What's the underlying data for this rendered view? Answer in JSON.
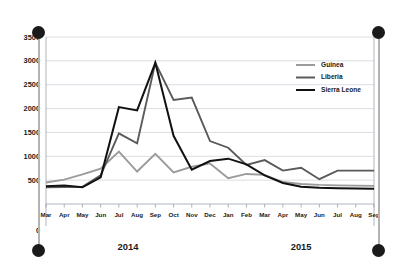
{
  "chart_data": {
    "type": "line",
    "title": "",
    "subtitle": "",
    "xlabel": "",
    "ylabel": "",
    "ylim": [
      0,
      3500
    ],
    "yticks": [
      0,
      500,
      1000,
      1500,
      2000,
      2500,
      3000,
      3500
    ],
    "ytick_labels": [
      "0",
      "500",
      "1000",
      "1500",
      "2000",
      "2500",
      "3000",
      "3500"
    ],
    "grid": true,
    "legend_position": "top-right",
    "categories": [
      "Mar",
      "Apr",
      "May",
      "Jun",
      "Jul",
      "Aug",
      "Sep",
      "Oct",
      "Nov",
      "Dec",
      "Jan",
      "Feb",
      "Mar",
      "Apr",
      "May",
      "Jun",
      "Jul",
      "Aug",
      "Sep"
    ],
    "group_labels": [
      {
        "label": "2014",
        "start_index": 0,
        "end_index": 9
      },
      {
        "label": "2015",
        "start_index": 10,
        "end_index": 18
      }
    ],
    "series": [
      {
        "name": "Guinea",
        "color": "#9b9b9b",
        "values": [
          450,
          510,
          620,
          740,
          1100,
          680,
          1050,
          660,
          780,
          850,
          540,
          630,
          610,
          460,
          420,
          400,
          390,
          385,
          380
        ]
      },
      {
        "name": "Liberia",
        "color": "#5a5a5a",
        "values": [
          350,
          355,
          360,
          600,
          1480,
          1270,
          2960,
          2180,
          2230,
          1320,
          1180,
          820,
          920,
          700,
          760,
          520,
          700,
          700,
          700
        ]
      },
      {
        "name": "Sierra Leone",
        "color": "#111111",
        "values": [
          370,
          390,
          350,
          560,
          2030,
          1960,
          2960,
          1430,
          720,
          900,
          950,
          830,
          600,
          440,
          360,
          340,
          330,
          325,
          320
        ]
      }
    ]
  },
  "legend": {
    "entries": [
      {
        "label": "Guinea"
      },
      {
        "label": "Liberia"
      },
      {
        "label": "Sierra Leone"
      }
    ]
  },
  "selection_frame": {
    "handles": [
      {
        "name": "top-left"
      },
      {
        "name": "top-right"
      },
      {
        "name": "bottom-left"
      },
      {
        "name": "bottom-right"
      }
    ]
  }
}
